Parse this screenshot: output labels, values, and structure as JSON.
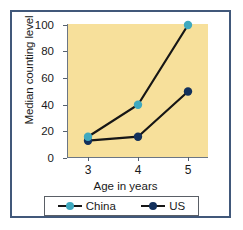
{
  "chart_data": {
    "type": "line",
    "title": "",
    "xlabel": "Age in years",
    "ylabel": "Median counting level",
    "x": [
      3,
      4,
      5
    ],
    "xtick_labels": [
      "3",
      "4",
      "5"
    ],
    "ytick_labels": [
      "0",
      "20",
      "40",
      "60",
      "80",
      "100"
    ],
    "yticks": [
      0,
      20,
      40,
      60,
      80,
      100
    ],
    "ylim": [
      0,
      105
    ],
    "xlim": [
      2.6,
      5.4
    ],
    "grid": false,
    "legend_position": "below-axes",
    "plot_background": "#f7e09b",
    "series": [
      {
        "name": "China",
        "values": [
          16,
          40,
          100
        ],
        "marker_color": "#3fa9bf",
        "line_color": "#161616"
      },
      {
        "name": "US",
        "values": [
          13,
          16,
          50
        ],
        "marker_color": "#12305c",
        "line_color": "#161616"
      }
    ]
  },
  "legend": {
    "entries": [
      {
        "label": "China",
        "color": "#3fa9bf"
      },
      {
        "label": "US",
        "color": "#12305c"
      }
    ]
  },
  "colors": {
    "frame_border": "#41587a",
    "axis": "#6b7684",
    "text": "#1a1a1a",
    "plot_bg": "#f7e09b",
    "china": "#3fa9bf",
    "us": "#12305c",
    "line": "#161616"
  }
}
